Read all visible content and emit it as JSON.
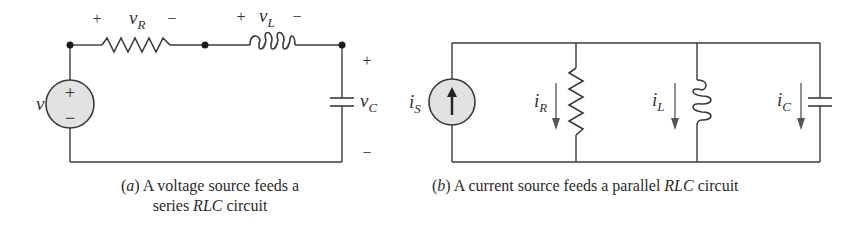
{
  "figure_a": {
    "caption_prefix": "(",
    "caption_letter": "a",
    "caption_line1_rest": ") A voltage source feeds a",
    "caption_line2_start": "series ",
    "caption_line2_italic": "RLC",
    "caption_line2_end": " circuit",
    "source_label": "v",
    "source_plus": "+",
    "source_minus": "−",
    "resistor": {
      "label_main": "v",
      "label_sub": "R",
      "plus": "+",
      "minus": "−"
    },
    "inductor": {
      "label_main": "v",
      "label_sub": "L",
      "plus": "+",
      "minus": "−"
    },
    "capacitor": {
      "label_main": "v",
      "label_sub": "C",
      "plus": "+",
      "minus": "−"
    }
  },
  "figure_b": {
    "caption_prefix": "(",
    "caption_letter": "b",
    "caption_rest": ") A current source feeds a parallel ",
    "caption_italic": "RLC",
    "caption_end": " circuit",
    "source": {
      "label_main": "i",
      "label_sub": "S"
    },
    "resistor": {
      "label_main": "i",
      "label_sub": "R"
    },
    "inductor": {
      "label_main": "i",
      "label_sub": "L"
    },
    "capacitor": {
      "label_main": "i",
      "label_sub": "C"
    }
  },
  "colors": {
    "wire": "#3a3a3a",
    "source_fill": "#e2e2e2",
    "text": "#333333"
  }
}
